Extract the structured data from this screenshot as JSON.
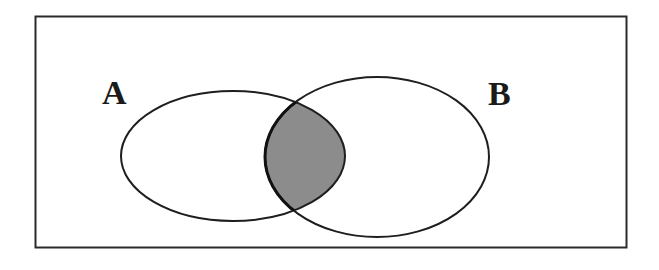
{
  "diagram": {
    "type": "venn",
    "universe": {
      "x": 35,
      "y": 16,
      "width": 592,
      "height": 232,
      "stroke": "#2a2a2a"
    },
    "sets": [
      {
        "id": "A",
        "label": "A",
        "label_x": 102,
        "label_y": 104,
        "cx": 233,
        "cy": 156,
        "rx": 112,
        "ry": 65
      },
      {
        "id": "B",
        "label": "B",
        "label_x": 488,
        "label_y": 105,
        "cx": 377,
        "cy": 157,
        "rx": 112,
        "ry": 80
      }
    ],
    "shaded_region": "A ∩ B",
    "colors": {
      "fill": "#8c8c8c",
      "stroke": "#1e1e1e",
      "background": "#ffffff"
    }
  }
}
